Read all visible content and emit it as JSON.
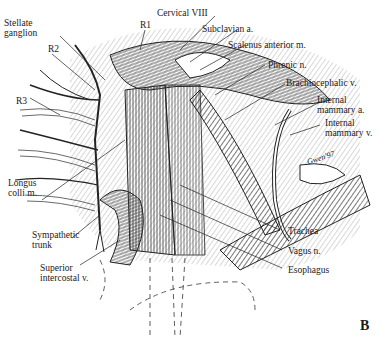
{
  "figure": {
    "panel_letter": "B",
    "signature": "Gwen '97",
    "labels": {
      "stellate_ganglion_1": "Stellate",
      "stellate_ganglion_2": "ganglion",
      "r1": "R1",
      "r2": "R2",
      "r3": "R3",
      "cervical_viii": "Cervical VIII",
      "subclavian_a": "Subclavian a.",
      "scalenus_anterior_m": "Scalenus anterior m.",
      "phrenic_n": "Phrenic n.",
      "brachiocephalic_v": "Brachiocephalic v.",
      "internal_mammary_a_1": "Internal",
      "internal_mammary_a_2": "mammary a.",
      "internal_mammary_v_1": "Internal",
      "internal_mammary_v_2": "mammary v.",
      "longus_colli_m_1": "Longus",
      "longus_colli_m_2": "colli m.",
      "sympathetic_trunk_1": "Sympathetic",
      "sympathetic_trunk_2": "trunk",
      "superior_intercostal_v_1": "Superior",
      "superior_intercostal_v_2": "intercostal v.",
      "trachea": "Trachea",
      "vagus_n": "Vagus n.",
      "esophagus": "Esophagus"
    }
  }
}
